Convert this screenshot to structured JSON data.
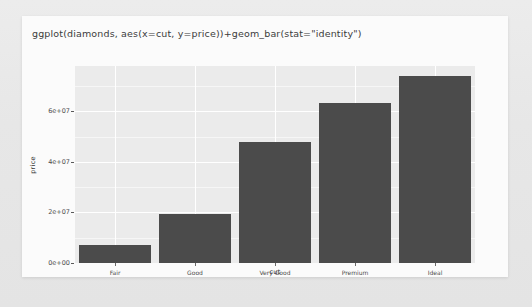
{
  "card": {
    "title": "ggplot(diamonds, aes(x=cut, y=price))+geom_bar(stat=\"identity\")"
  },
  "chart_data": {
    "type": "bar",
    "title": "ggplot(diamonds, aes(x=cut, y=price))+geom_bar(stat=\"identity\")",
    "xlabel": "cut",
    "ylabel": "price",
    "categories": [
      "Fair",
      "Good",
      "Very Good",
      "Premium",
      "Ideal"
    ],
    "values": [
      7017600,
      19275000,
      48107600,
      63221500,
      74122600
    ],
    "ylim": [
      0,
      78000000
    ],
    "yticks": [
      0,
      20000000,
      40000000,
      60000000
    ],
    "ytick_labels": [
      "0e+00",
      "2e+07",
      "4e+07",
      "6e+07"
    ],
    "grid": true,
    "legend": "none",
    "bar_color": "#4b4b4b",
    "panel_color": "#ebebeb",
    "gridline_color": "#ffffff"
  }
}
